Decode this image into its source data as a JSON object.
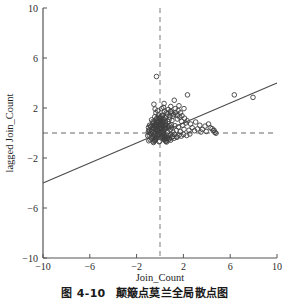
{
  "figure": {
    "caption_number": "图 4-10",
    "caption_text": "颠簸点莫兰全局散点图"
  },
  "chart_data": {
    "type": "scatter",
    "title": "",
    "xlabel": "Join_Count",
    "ylabel": "lagged Join_Count",
    "xlim": [
      -10,
      10
    ],
    "ylim": [
      -10,
      10
    ],
    "xticks": [
      -10,
      -6,
      -2,
      2,
      6,
      10
    ],
    "yticks": [
      -10,
      -6,
      -2,
      2,
      6,
      10
    ],
    "xticklabels": [
      "-10",
      "-6",
      "-2",
      "2",
      "6",
      "10"
    ],
    "yticklabels": [
      "-10",
      "-6",
      "-2",
      "2",
      "6",
      "10"
    ],
    "grid": false,
    "legend": null,
    "marker": {
      "shape": "circle-open",
      "size": 2.3,
      "edge_color": "#404040",
      "face_color": "none"
    },
    "reference_lines": [
      {
        "name": "vertical-mean-line",
        "orientation": "vertical",
        "value": 0,
        "style": "dashed",
        "color": "#9a9a9a"
      },
      {
        "name": "horizontal-mean-line",
        "orientation": "horizontal",
        "value": 0,
        "style": "dashed",
        "color": "#9a9a9a"
      }
    ],
    "fit_line": {
      "name": "morans-i-regression-line",
      "slope": 0.4,
      "intercept": 0.0,
      "x_start": -10,
      "y_start": -4.0,
      "x_end": 10,
      "y_end": 4.0,
      "color": "#4a4a4a",
      "width": 1.1
    },
    "points": [
      [
        -0.3,
        4.52
      ],
      [
        -0.52,
        2.3
      ],
      [
        0.35,
        2.36
      ],
      [
        1.22,
        2.62
      ],
      [
        2.35,
        3.05
      ],
      [
        6.35,
        3.05
      ],
      [
        7.95,
        2.85
      ],
      [
        0.3,
        2.05
      ],
      [
        0.95,
        1.7
      ],
      [
        1.3,
        1.95
      ],
      [
        1.55,
        1.8
      ],
      [
        1.1,
        1.35
      ],
      [
        0.62,
        1.52
      ],
      [
        0.2,
        1.38
      ],
      [
        -0.12,
        1.45
      ],
      [
        -0.45,
        1.3
      ],
      [
        0.05,
        1.18
      ],
      [
        0.42,
        1.22
      ],
      [
        0.78,
        1.08
      ],
      [
        1.02,
        1.0
      ],
      [
        1.48,
        1.12
      ],
      [
        1.85,
        0.92
      ],
      [
        2.2,
        0.8
      ],
      [
        2.62,
        0.72
      ],
      [
        3.05,
        0.88
      ],
      [
        3.4,
        0.62
      ],
      [
        3.85,
        0.55
      ],
      [
        4.3,
        0.42
      ],
      [
        4.55,
        0.18
      ],
      [
        4.7,
        0.05
      ],
      [
        4.15,
        0.72
      ],
      [
        3.62,
        0.28
      ],
      [
        2.95,
        0.18
      ],
      [
        2.48,
        0.22
      ],
      [
        2.05,
        0.3
      ],
      [
        1.72,
        0.12
      ],
      [
        1.4,
        0.2
      ],
      [
        1.12,
        0.08
      ],
      [
        0.88,
        0.25
      ],
      [
        0.65,
        0.1
      ],
      [
        0.45,
        0.32
      ],
      [
        0.28,
        0.05
      ],
      [
        0.12,
        0.42
      ],
      [
        -0.05,
        0.15
      ],
      [
        -0.22,
        0.28
      ],
      [
        -0.38,
        0.08
      ],
      [
        -0.55,
        0.35
      ],
      [
        -0.7,
        0.12
      ],
      [
        -0.85,
        0.02
      ],
      [
        -0.95,
        0.22
      ],
      [
        0.02,
        0.78
      ],
      [
        0.18,
        0.62
      ],
      [
        0.33,
        0.85
      ],
      [
        0.5,
        0.68
      ],
      [
        0.68,
        0.92
      ],
      [
        -0.15,
        0.7
      ],
      [
        -0.3,
        0.88
      ],
      [
        -0.48,
        0.6
      ],
      [
        -0.62,
        0.78
      ],
      [
        -0.78,
        0.55
      ],
      [
        -0.05,
        -0.12
      ],
      [
        0.1,
        -0.25
      ],
      [
        0.25,
        -0.08
      ],
      [
        0.4,
        -0.3
      ],
      [
        0.58,
        -0.15
      ],
      [
        -0.2,
        -0.18
      ],
      [
        -0.35,
        -0.32
      ],
      [
        -0.5,
        -0.1
      ],
      [
        -0.65,
        -0.28
      ],
      [
        -0.8,
        -0.05
      ],
      [
        0.75,
        -0.22
      ],
      [
        0.92,
        -0.1
      ],
      [
        1.08,
        -0.28
      ],
      [
        1.25,
        -0.12
      ],
      [
        1.42,
        -0.3
      ],
      [
        1.62,
        -0.18
      ],
      [
        1.82,
        -0.25
      ],
      [
        2.02,
        -0.12
      ],
      [
        2.28,
        -0.2
      ],
      [
        2.55,
        -0.08
      ],
      [
        0.03,
        0.48
      ],
      [
        0.15,
        0.35
      ],
      [
        0.27,
        0.52
      ],
      [
        0.38,
        0.4
      ],
      [
        0.48,
        0.58
      ],
      [
        -0.08,
        0.45
      ],
      [
        -0.18,
        0.55
      ],
      [
        -0.28,
        0.38
      ],
      [
        -0.4,
        0.5
      ],
      [
        -0.52,
        0.42
      ],
      [
        0.05,
        0.92
      ],
      [
        0.2,
        1.05
      ],
      [
        -0.1,
        0.98
      ],
      [
        -0.25,
        1.12
      ],
      [
        0.45,
        0.95
      ],
      [
        -0.6,
        0.92
      ],
      [
        -0.72,
        1.05
      ],
      [
        0.58,
        1.35
      ],
      [
        0.82,
        1.28
      ],
      [
        -0.35,
        1.62
      ],
      [
        0.0,
        0.02
      ],
      [
        0.06,
        -0.04
      ],
      [
        -0.06,
        0.06
      ],
      [
        0.12,
        0.1
      ],
      [
        -0.12,
        -0.08
      ],
      [
        0.18,
        -0.02
      ],
      [
        -0.18,
        0.14
      ],
      [
        0.24,
        0.18
      ],
      [
        -0.24,
        -0.14
      ],
      [
        0.3,
        -0.18
      ],
      [
        -0.3,
        0.22
      ],
      [
        0.36,
        0.26
      ],
      [
        -0.36,
        -0.22
      ],
      [
        0.42,
        -0.26
      ],
      [
        -0.42,
        0.3
      ],
      [
        0.48,
        0.34
      ],
      [
        -0.48,
        -0.3
      ],
      [
        0.54,
        -0.34
      ],
      [
        -0.54,
        0.38
      ],
      [
        0.6,
        0.42
      ],
      [
        -0.6,
        -0.38
      ],
      [
        0.66,
        -0.42
      ],
      [
        -0.66,
        0.46
      ],
      [
        0.72,
        0.5
      ],
      [
        -0.72,
        -0.46
      ],
      [
        0.78,
        -0.5
      ],
      [
        -0.78,
        0.54
      ],
      [
        0.84,
        0.58
      ],
      [
        -0.84,
        -0.54
      ],
      [
        0.9,
        -0.58
      ],
      [
        -0.9,
        0.62
      ],
      [
        0.96,
        0.66
      ],
      [
        -0.96,
        -0.62
      ],
      [
        0.02,
        0.7
      ],
      [
        -0.02,
        -0.66
      ],
      [
        0.08,
        0.74
      ],
      [
        -0.08,
        -0.7
      ],
      [
        0.14,
        0.3
      ],
      [
        -0.14,
        -0.26
      ],
      [
        0.2,
        -0.34
      ],
      [
        0.26,
        0.62
      ],
      [
        -0.26,
        0.58
      ],
      [
        0.32,
        -0.46
      ],
      [
        -0.32,
        0.66
      ],
      [
        0.38,
        -0.54
      ],
      [
        -0.38,
        0.74
      ],
      [
        0.44,
        0.82
      ],
      [
        -0.44,
        -0.58
      ],
      [
        0.5,
        -0.66
      ],
      [
        -0.5,
        0.86
      ],
      [
        0.04,
        1.22
      ],
      [
        -0.04,
        1.15
      ],
      [
        0.1,
        1.3
      ],
      [
        -0.1,
        1.25
      ],
      [
        0.16,
        1.42
      ],
      [
        -0.16,
        0.84
      ],
      [
        0.22,
        0.9
      ],
      [
        -0.22,
        0.96
      ],
      [
        0.28,
        1.08
      ],
      [
        -0.28,
        1.18
      ],
      [
        0.34,
        -0.38
      ],
      [
        -0.34,
        -0.42
      ],
      [
        0.4,
        -0.48
      ],
      [
        -0.4,
        -0.52
      ],
      [
        0.46,
        -0.56
      ],
      [
        -0.46,
        -0.6
      ],
      [
        0.52,
        -0.64
      ],
      [
        -0.52,
        -0.68
      ],
      [
        0.56,
        -0.72
      ],
      [
        -0.56,
        -0.76
      ],
      [
        1.05,
        1.58
      ],
      [
        0.88,
        1.72
      ],
      [
        1.18,
        1.48
      ],
      [
        1.32,
        1.62
      ],
      [
        1.5,
        1.42
      ],
      [
        1.68,
        1.28
      ],
      [
        1.88,
        1.38
      ],
      [
        2.1,
        1.18
      ],
      [
        2.32,
        0.98
      ],
      [
        1.95,
        0.62
      ],
      [
        1.58,
        0.48
      ],
      [
        1.28,
        0.58
      ],
      [
        0.98,
        0.45
      ],
      [
        2.75,
        0.42
      ],
      [
        3.2,
        0.32
      ],
      [
        4.45,
        0.35
      ],
      [
        4.62,
        0.22
      ],
      [
        4.78,
        -0.02
      ],
      [
        3.95,
        0.12
      ],
      [
        3.5,
        0.08
      ],
      [
        0.7,
        1.88
      ],
      [
        0.92,
        2.12
      ],
      [
        1.62,
        2.18
      ],
      [
        2.05,
        1.95
      ],
      [
        0.15,
        1.95
      ],
      [
        -0.2,
        1.78
      ],
      [
        -0.42,
        1.92
      ],
      [
        0.55,
        1.62
      ],
      [
        0.38,
        1.75
      ],
      [
        1.75,
        1.62
      ],
      [
        0.62,
        -0.38
      ],
      [
        0.8,
        -0.44
      ],
      [
        1.0,
        -0.36
      ],
      [
        1.2,
        -0.42
      ],
      [
        1.45,
        -0.34
      ],
      [
        -0.88,
        0.18
      ],
      [
        -0.92,
        -0.16
      ],
      [
        -1.0,
        0.08
      ],
      [
        -1.05,
        -0.22
      ],
      [
        -0.98,
        0.44
      ]
    ]
  }
}
